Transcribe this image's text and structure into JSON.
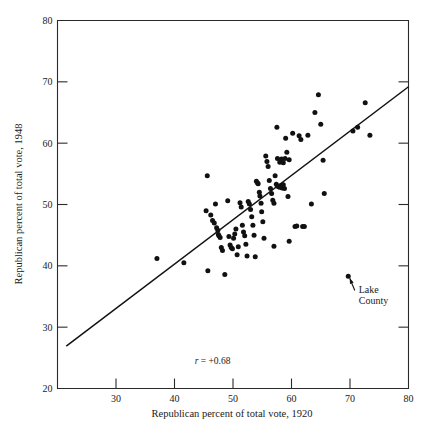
{
  "chart_data": {
    "type": "scatter",
    "title": "",
    "xlabel": "Republican percent of total vote, 1920",
    "ylabel": "Republican percent of total vote, 1948",
    "xlim": [
      20,
      80
    ],
    "ylim": [
      20,
      80
    ],
    "xticks": [
      30,
      40,
      50,
      60,
      70,
      80
    ],
    "yticks": [
      20,
      30,
      40,
      50,
      60,
      70,
      80
    ],
    "grid": false,
    "legend": "none",
    "annotations": [
      {
        "name": "correlation",
        "text_italic": "r",
        "text_rest": " = +0.68",
        "full_text": "r = +0.68",
        "x": 46.5,
        "y": 24.0
      },
      {
        "name": "lake-county-callout",
        "line1": "Lake",
        "line2": "County",
        "full_text": "Lake County",
        "point_x": 69.7,
        "point_y": 38.3,
        "label_x": 71.5,
        "label_y": 35.5
      }
    ],
    "fit_line": {
      "name": "regression-line",
      "x_start": 21.5,
      "y_start": 26.9,
      "x_end": 80.0,
      "y_end": 69.2,
      "slope": 0.723,
      "intercept": 11.35
    },
    "series": [
      {
        "name": "Illinois counties",
        "marker": "filled-circle",
        "color": "#111111",
        "points": [
          [
            37.0,
            41.2
          ],
          [
            41.6,
            40.5
          ],
          [
            45.6,
            54.7
          ],
          [
            45.4,
            49.0
          ],
          [
            45.7,
            39.2
          ],
          [
            46.2,
            48.3
          ],
          [
            46.5,
            47.4
          ],
          [
            46.8,
            47.0
          ],
          [
            47.0,
            50.1
          ],
          [
            47.2,
            46.2
          ],
          [
            47.4,
            45.8
          ],
          [
            47.5,
            45.1
          ],
          [
            47.6,
            44.9
          ],
          [
            47.8,
            44.6
          ],
          [
            48.0,
            43.0
          ],
          [
            48.2,
            42.5
          ],
          [
            48.6,
            38.6
          ],
          [
            49.1,
            50.6
          ],
          [
            49.3,
            44.8
          ],
          [
            49.5,
            43.4
          ],
          [
            49.7,
            43.0
          ],
          [
            49.9,
            42.8
          ],
          [
            50.1,
            44.5
          ],
          [
            50.3,
            45.2
          ],
          [
            50.5,
            46.0
          ],
          [
            50.7,
            41.8
          ],
          [
            50.9,
            43.1
          ],
          [
            51.2,
            50.3
          ],
          [
            51.4,
            49.6
          ],
          [
            51.6,
            46.6
          ],
          [
            51.8,
            45.5
          ],
          [
            52.0,
            44.9
          ],
          [
            52.2,
            43.5
          ],
          [
            52.4,
            41.6
          ],
          [
            52.6,
            50.5
          ],
          [
            52.8,
            50.1
          ],
          [
            53.0,
            49.2
          ],
          [
            53.2,
            48.0
          ],
          [
            53.4,
            46.6
          ],
          [
            53.6,
            45.0
          ],
          [
            53.8,
            41.5
          ],
          [
            54.0,
            53.8
          ],
          [
            54.2,
            53.5
          ],
          [
            54.3,
            53.4
          ],
          [
            54.5,
            52.0
          ],
          [
            54.6,
            51.4
          ],
          [
            54.8,
            50.2
          ],
          [
            54.9,
            48.8
          ],
          [
            55.1,
            47.2
          ],
          [
            55.3,
            44.5
          ],
          [
            55.6,
            57.9
          ],
          [
            55.8,
            57.0
          ],
          [
            56.0,
            56.2
          ],
          [
            56.2,
            53.9
          ],
          [
            56.4,
            52.6
          ],
          [
            56.6,
            51.8
          ],
          [
            56.8,
            50.7
          ],
          [
            57.0,
            50.2
          ],
          [
            57.2,
            54.7
          ],
          [
            57.4,
            53.3
          ],
          [
            57.6,
            53.0
          ],
          [
            57.8,
            52.9
          ],
          [
            58.0,
            52.8
          ],
          [
            58.2,
            53.1
          ],
          [
            58.4,
            52.7
          ],
          [
            58.6,
            53.2
          ],
          [
            58.8,
            52.6
          ],
          [
            57.0,
            43.2
          ],
          [
            57.6,
            57.5
          ],
          [
            58.0,
            56.9
          ],
          [
            58.3,
            57.4
          ],
          [
            58.6,
            56.8
          ],
          [
            58.9,
            57.5
          ],
          [
            59.2,
            58.5
          ],
          [
            59.4,
            51.3
          ],
          [
            59.6,
            44.0
          ],
          [
            57.5,
            62.6
          ],
          [
            59.0,
            60.8
          ],
          [
            59.6,
            57.3
          ],
          [
            60.2,
            61.6
          ],
          [
            60.6,
            46.4
          ],
          [
            60.9,
            46.5
          ],
          [
            61.3,
            61.2
          ],
          [
            61.6,
            60.6
          ],
          [
            61.9,
            46.4
          ],
          [
            62.2,
            46.4
          ],
          [
            62.8,
            61.3
          ],
          [
            63.4,
            50.1
          ],
          [
            64.0,
            65.0
          ],
          [
            64.6,
            67.9
          ],
          [
            65.0,
            63.1
          ],
          [
            65.4,
            57.2
          ],
          [
            65.6,
            51.8
          ],
          [
            70.5,
            62.0
          ],
          [
            71.3,
            62.6
          ],
          [
            72.6,
            66.6
          ],
          [
            73.4,
            61.3
          ],
          [
            69.7,
            38.3
          ]
        ]
      }
    ]
  },
  "axis": {
    "y_title": "Republican percent of total vote, 1948",
    "x_title": "Republican percent of total vote, 1920",
    "x_tick_labels": [
      "30",
      "40",
      "50",
      "60",
      "70",
      "80"
    ],
    "y_tick_labels": [
      "80",
      "70",
      "60",
      "50",
      "40",
      "30",
      "20"
    ]
  },
  "colors": {
    "background": "#ffffff",
    "ink": "#111111",
    "axis": "#2a2a2a"
  }
}
